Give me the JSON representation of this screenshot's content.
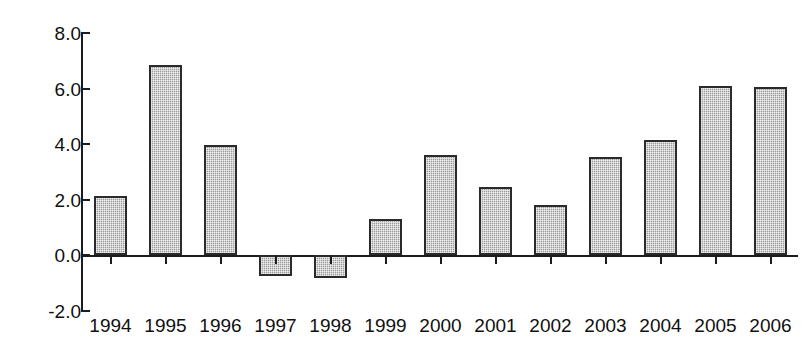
{
  "chart_data": {
    "type": "bar",
    "title": "",
    "subtitle": "",
    "xlabel": "",
    "ylabel": "",
    "categories": [
      "1994",
      "1995",
      "1996",
      "1997",
      "1998",
      "1999",
      "2000",
      "2001",
      "2002",
      "2003",
      "2004",
      "2005",
      "2006"
    ],
    "values": [
      2.15,
      6.85,
      3.97,
      -0.75,
      -0.8,
      1.3,
      3.6,
      2.45,
      1.8,
      3.55,
      4.15,
      6.1,
      6.05
    ],
    "ylim": [
      -2.0,
      8.0
    ],
    "y_ticks": [
      8.0,
      6.0,
      4.0,
      2.0,
      0.0,
      -2.0
    ],
    "y_tick_labels": [
      "8.0",
      "6.0",
      "4.0",
      "2.0",
      "0.0",
      "-2.0"
    ],
    "grid": false,
    "legend": null,
    "legend_position": "none",
    "annotations": [],
    "colors": {
      "bar_fill": "#a8a8a8",
      "bar_border": "#2a2a2a",
      "axis": "#1c1c1c",
      "text": "#101010",
      "background": "#ffffff"
    }
  }
}
